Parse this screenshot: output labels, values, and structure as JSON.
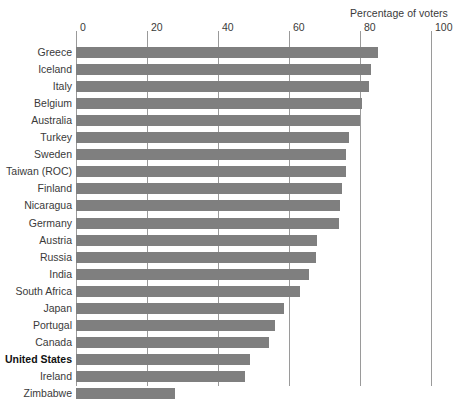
{
  "chart_data": {
    "type": "bar",
    "orientation": "horizontal",
    "title": "Percentage of voters",
    "xlabel": "",
    "ylabel": "",
    "xlim": [
      0,
      100
    ],
    "xticks": [
      0,
      20,
      40,
      60,
      80,
      100
    ],
    "grid": "vertical",
    "legend": "none",
    "bar_color": "#7f7f7f",
    "highlight_category": "United States",
    "categories": [
      "Greece",
      "Iceland",
      "Italy",
      "Belgium",
      "Australia",
      "Turkey",
      "Sweden",
      "Taiwan (ROC)",
      "Finland",
      "Nicaragua",
      "Germany",
      "Austria",
      "Russia",
      "India",
      "South Africa",
      "Japan",
      "Portugal",
      "Canada",
      "United States",
      "Ireland",
      "Zimbabwe"
    ],
    "values": [
      85,
      83,
      82.5,
      80.5,
      80,
      77,
      76,
      76,
      75,
      74.5,
      74,
      68,
      67.5,
      65.5,
      63,
      58.5,
      56,
      54.5,
      49,
      47.5,
      28
    ]
  }
}
